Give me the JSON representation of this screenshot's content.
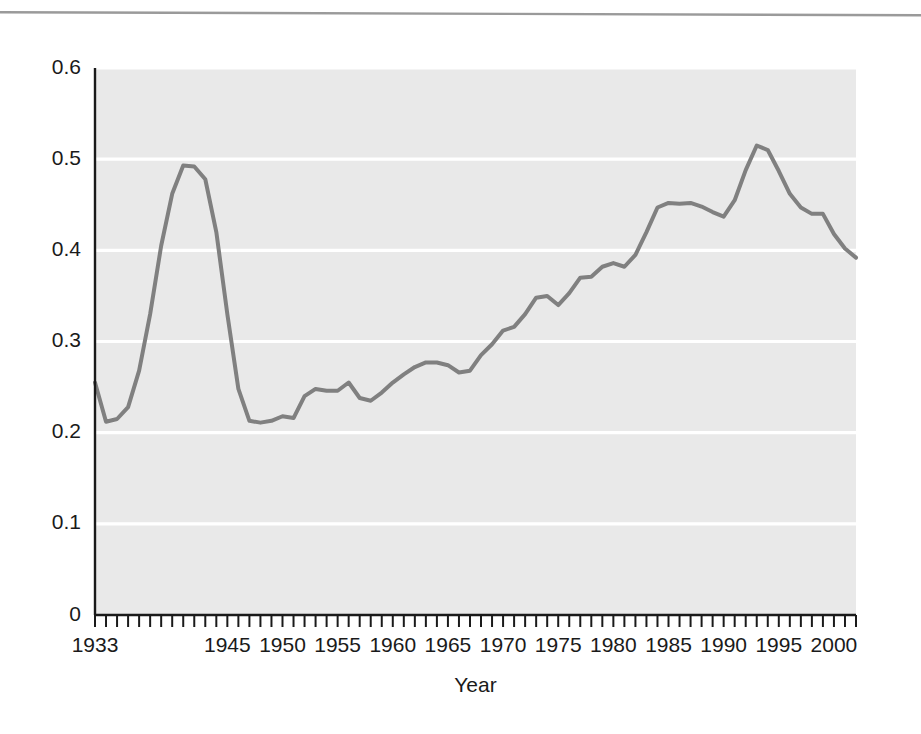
{
  "figure": {
    "background_color": "#ffffff",
    "plot_background_color": "#e9e9e9",
    "gridline_color": "#ffffff",
    "line_color": "#808080",
    "axis_color": "#1a1a1a",
    "text_color": "#1a1a1a",
    "scan_artifact_color": "#9a9a9a"
  },
  "chart_data": {
    "type": "line",
    "title": "",
    "subtitle": "",
    "xlabel": "Year",
    "ylabel": "",
    "xlim": [
      1933,
      2002
    ],
    "ylim": [
      0,
      0.6
    ],
    "grid": true,
    "grid_axis": "y",
    "legend": null,
    "legend_position": "none",
    "y_ticks": [
      0,
      0.1,
      0.2,
      0.3,
      0.4,
      0.5,
      0.6
    ],
    "y_tick_labels": [
      "0",
      "0.1",
      "0.2",
      "0.3",
      "0.4",
      "0.5",
      "0.6"
    ],
    "x_tick_labels": [
      "1933",
      "1945",
      "1950",
      "1955",
      "1960",
      "1965",
      "1970",
      "1975",
      "1980",
      "1985",
      "1990",
      "1995",
      "2000"
    ],
    "x_tick_label_values": [
      1933,
      1945,
      1950,
      1955,
      1960,
      1965,
      1970,
      1975,
      1980,
      1985,
      1990,
      1995,
      2000
    ],
    "x_minor_tick_interval": 1,
    "series": [
      {
        "name": "series-1",
        "color": "#808080",
        "line_width": 4,
        "x": [
          1933,
          1934,
          1935,
          1936,
          1937,
          1938,
          1939,
          1940,
          1941,
          1942,
          1943,
          1944,
          1945,
          1946,
          1947,
          1948,
          1949,
          1950,
          1951,
          1952,
          1953,
          1954,
          1955,
          1956,
          1957,
          1958,
          1959,
          1960,
          1961,
          1962,
          1963,
          1964,
          1965,
          1966,
          1967,
          1968,
          1969,
          1970,
          1971,
          1972,
          1973,
          1974,
          1975,
          1976,
          1977,
          1978,
          1979,
          1980,
          1981,
          1982,
          1983,
          1984,
          1985,
          1986,
          1987,
          1988,
          1989,
          1990,
          1991,
          1992,
          1993,
          1994,
          1995,
          1996,
          1997,
          1998,
          1999,
          2000,
          2001,
          2002
        ],
        "y": [
          0.255,
          0.212,
          0.215,
          0.228,
          0.268,
          0.33,
          0.405,
          0.462,
          0.493,
          0.492,
          0.478,
          0.42,
          0.33,
          0.248,
          0.213,
          0.211,
          0.213,
          0.218,
          0.216,
          0.24,
          0.248,
          0.246,
          0.246,
          0.255,
          0.238,
          0.235,
          0.244,
          0.255,
          0.264,
          0.272,
          0.277,
          0.277,
          0.274,
          0.266,
          0.268,
          0.285,
          0.297,
          0.312,
          0.316,
          0.33,
          0.348,
          0.35,
          0.34,
          0.353,
          0.37,
          0.371,
          0.382,
          0.386,
          0.382,
          0.395,
          0.42,
          0.447,
          0.452,
          0.451,
          0.452,
          0.448,
          0.442,
          0.437,
          0.455,
          0.488,
          0.515,
          0.51,
          0.487,
          0.462,
          0.447,
          0.44,
          0.44,
          0.418,
          0.402,
          0.392
        ]
      }
    ]
  }
}
